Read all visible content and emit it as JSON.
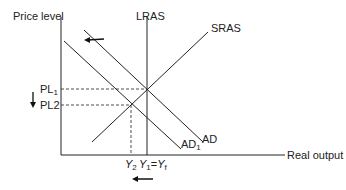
{
  "diagram": {
    "type": "AD-AS model",
    "y_axis_label": "Price level",
    "x_axis_label": "Real output",
    "curves": {
      "lras": "LRAS",
      "sras": "SRAS",
      "ad": "AD",
      "ad1_main": "AD",
      "ad1_sub": "1"
    },
    "price_levels": {
      "pl1_main": "PL",
      "pl1_sub": "1",
      "pl2": "PL2"
    },
    "outputs": {
      "y2_main": "Y",
      "y2_sub": "2",
      "y1_main": "Y",
      "y1_sub": "1",
      "eq": "=",
      "yf_main": "Y",
      "yf_sub": "f"
    },
    "colors": {
      "line": "#222222",
      "background": "#ffffff"
    }
  }
}
